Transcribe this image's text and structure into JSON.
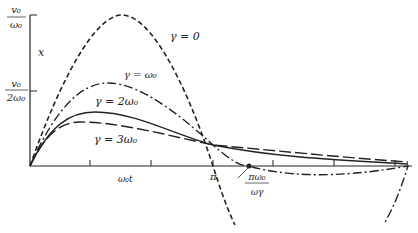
{
  "figure": {
    "y_axis": {
      "label": "x",
      "ticks": [
        {
          "num": "v₀",
          "den": "ω₀",
          "value": "v0/omega0"
        },
        {
          "num": "v₀",
          "den": "2ω₀",
          "value": "v0/(2 omega0)"
        }
      ]
    },
    "x_axis": {
      "label": "ω₀t",
      "tick_pi": "π",
      "marker_num": "πω₀",
      "marker_den": "ωγ"
    },
    "curves": [
      {
        "label": "γ = 0",
        "style": "dashed-short"
      },
      {
        "label": "γ = ω₀",
        "style": "dash-dot"
      },
      {
        "label": "γ = 2ω₀",
        "style": "solid"
      },
      {
        "label": "γ = 3ω₀",
        "style": "dashed-long"
      }
    ]
  }
}
